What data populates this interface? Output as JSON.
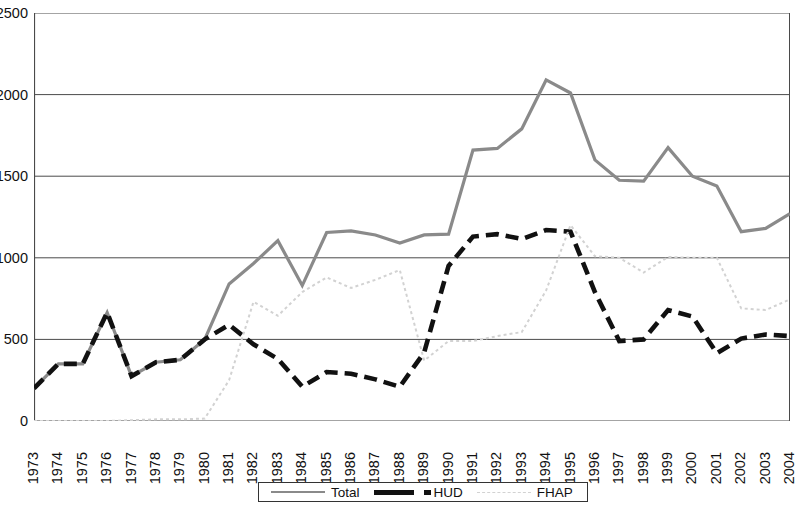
{
  "chart_data": {
    "type": "line",
    "title": "",
    "subtitle": "",
    "xlabel": "",
    "ylabel": "",
    "ylim": [
      0,
      2500
    ],
    "ytick_labels": [
      "0",
      "500",
      "1000",
      "1500",
      "2000",
      "2500"
    ],
    "ytick_values": [
      0,
      500,
      1000,
      1500,
      2000,
      2500
    ],
    "grid": true,
    "grid_axis": "y",
    "legend_position": "bottom",
    "categories": [
      "1973",
      "1974",
      "1975",
      "1976",
      "1977",
      "1978",
      "1979",
      "1980",
      "1981",
      "1982",
      "1983",
      "1984",
      "1985",
      "1986",
      "1987",
      "1988",
      "1989",
      "1990",
      "1991",
      "1992",
      "1993",
      "1994",
      "1995",
      "1996",
      "1997",
      "1998",
      "1999",
      "2000",
      "2001",
      "2002",
      "2003",
      "2004"
    ],
    "series": [
      {
        "name": "Total",
        "color": "#8a8a8a",
        "style": "solid",
        "values": [
          200,
          350,
          350,
          665,
          275,
          360,
          375,
          500,
          840,
          965,
          1105,
          830,
          1155,
          1165,
          1140,
          1090,
          1140,
          1145,
          1660,
          1670,
          1790,
          2090,
          2010,
          1600,
          1475,
          1470,
          1675,
          1500,
          1440,
          1160,
          1180,
          1270
        ]
      },
      {
        "name": "HUD",
        "color": "#111111",
        "style": "dashed",
        "values": [
          200,
          350,
          350,
          665,
          275,
          360,
          375,
          500,
          590,
          470,
          380,
          210,
          300,
          290,
          255,
          210,
          420,
          950,
          1130,
          1145,
          1115,
          1170,
          1160,
          790,
          490,
          500,
          680,
          640,
          415,
          505,
          530,
          520
        ]
      },
      {
        "name": "FHAP",
        "color": "#d2d2d2",
        "style": "dotted",
        "values": [
          0,
          0,
          0,
          0,
          5,
          10,
          10,
          15,
          250,
          730,
          645,
          790,
          880,
          815,
          865,
          925,
          370,
          490,
          490,
          520,
          545,
          800,
          1200,
          1010,
          1000,
          910,
          1005,
          1000,
          1000,
          690,
          680,
          745
        ]
      }
    ]
  },
  "legend": {
    "items": [
      {
        "label": "Total",
        "swatch": "solid-gray-line"
      },
      {
        "label": "HUD",
        "swatch": "thick-black-dash"
      },
      {
        "label": "FHAP",
        "swatch": "light-dotted-line"
      }
    ]
  }
}
